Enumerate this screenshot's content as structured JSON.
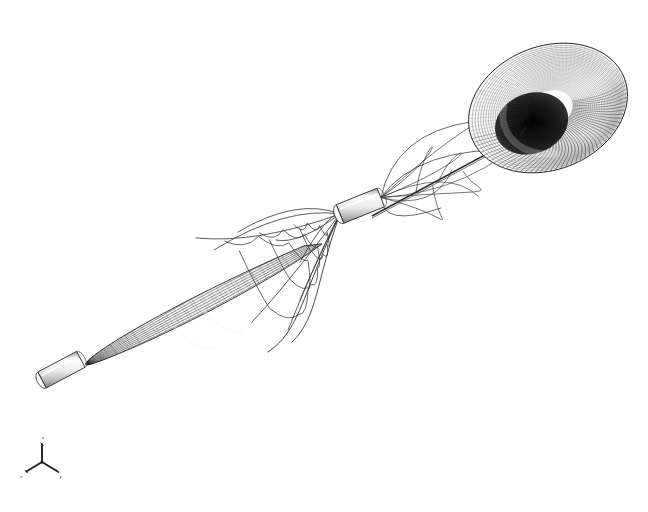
{
  "figure": {
    "title": "3D wireframe mesh visualization",
    "background_color": "#ffffff",
    "line_color": "#2b2b2b",
    "mesh_color": "#4a4a4a",
    "highlight_color": "#f2f2f2",
    "shade_color": "#8a8a8a",
    "width": 648,
    "height": 512,
    "render_style": "hidden-line wireframe",
    "projection": "perspective"
  },
  "objects": {
    "bulb": {
      "name": "teardrop-bulb-surface",
      "center_x": 200,
      "center_y": 305,
      "radius_x": 128,
      "radius_y": 92,
      "rotation_deg": -28,
      "mesh_meridians": 110,
      "mesh_parallels": 26,
      "fill": "#6e6e6e"
    },
    "bulb_tip_cylinder": {
      "name": "bulb-tip-cap",
      "x": 42,
      "y": 380,
      "length": 44,
      "radius": 9,
      "rotation_deg": -28,
      "fill": "#f4f4f4"
    },
    "center_cylinder": {
      "name": "center-connector-cylinder",
      "x": 340,
      "y": 214,
      "length": 44,
      "radius": 10,
      "rotation_deg": -22,
      "fill": "#f0f0f0"
    },
    "funnel": {
      "name": "funnel-torus-surface",
      "center_x": 548,
      "center_y": 108,
      "radius_x": 82,
      "radius_y": 70,
      "rotation_deg": -22,
      "throat_radius_x": 30,
      "throat_radius_y": 24,
      "mesh_meridians": 96,
      "mesh_parallels": 34,
      "fill": "#585858",
      "throat_fill": "#101010"
    },
    "axis_line": {
      "name": "central-axis-line",
      "x1": 372,
      "y1": 216,
      "x2": 520,
      "y2": 136
    },
    "tendrils": {
      "name": "mesh-tendril-curves",
      "count": 10,
      "color": "#3a3a3a"
    }
  },
  "axes_triad": {
    "name": "orientation-axis-triad",
    "x": 42,
    "y": 462,
    "size": 17,
    "labels": [
      "x",
      "y",
      "z"
    ],
    "color": "#1f1f1f"
  }
}
